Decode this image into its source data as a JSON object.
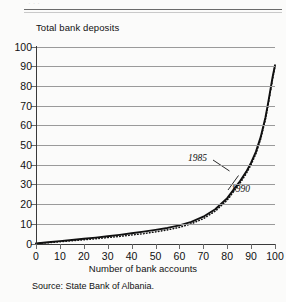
{
  "figure": {
    "crop_remnant_text": "· · ·",
    "source_note": "Source:  State Bank of Albania."
  },
  "chart_data": {
    "type": "line",
    "title": "",
    "subtitle": "",
    "ylabel": "Total bank deposits",
    "xlabel": "Number of bank accounts",
    "xlim": [
      0,
      100
    ],
    "ylim": [
      0,
      100
    ],
    "xticks": [
      0,
      10,
      20,
      30,
      40,
      50,
      60,
      70,
      80,
      90,
      100
    ],
    "yticks": [
      0,
      10,
      20,
      30,
      40,
      50,
      60,
      70,
      80,
      90,
      100
    ],
    "xticklabels": [
      "0",
      "10",
      "20",
      "30",
      "40",
      "50",
      "60",
      "70",
      "80",
      "90",
      "100"
    ],
    "yticklabels": [
      "0",
      "10",
      "20",
      "30",
      "40",
      "50",
      "60",
      "70",
      "80",
      "90",
      "100"
    ],
    "grid": "horizontal",
    "legend": "none",
    "series": [
      {
        "name": "1990",
        "style": "solid",
        "color": "#111111",
        "x": [
          0,
          5,
          10,
          15,
          20,
          25,
          30,
          35,
          40,
          45,
          50,
          55,
          60,
          65,
          70,
          75,
          80,
          85,
          88,
          90,
          92,
          94,
          96,
          97,
          98,
          99,
          100
        ],
        "y": [
          0,
          0.6,
          1.2,
          1.8,
          2.4,
          3.0,
          3.7,
          4.4,
          5.2,
          6.0,
          6.9,
          7.9,
          9.2,
          11.0,
          13.6,
          17.4,
          23.0,
          31.0,
          36.5,
          41.0,
          46.5,
          54.0,
          64.0,
          70.5,
          77.5,
          84.5,
          90.5
        ]
      },
      {
        "name": "1985",
        "style": "dotted",
        "color": "#111111",
        "x": [
          0,
          5,
          10,
          15,
          20,
          25,
          30,
          35,
          40,
          45,
          50,
          55,
          60,
          65,
          70,
          75,
          80,
          85,
          88,
          90,
          92,
          94,
          96,
          97,
          98,
          99,
          100
        ],
        "y": [
          0,
          0.4,
          0.9,
          1.4,
          1.9,
          2.4,
          3.0,
          3.6,
          4.3,
          5.0,
          5.9,
          6.9,
          8.2,
          10.0,
          12.6,
          16.4,
          22.0,
          30.0,
          35.5,
          40.0,
          45.5,
          53.0,
          63.0,
          69.5,
          76.5,
          83.5,
          90.0
        ]
      }
    ],
    "annotations": [
      {
        "label": "1985",
        "x": 89,
        "y": 40,
        "note": "leader line to upper curve"
      },
      {
        "label": "1990",
        "x": 95,
        "y": 26,
        "note": "leader line to lower curve"
      }
    ]
  }
}
